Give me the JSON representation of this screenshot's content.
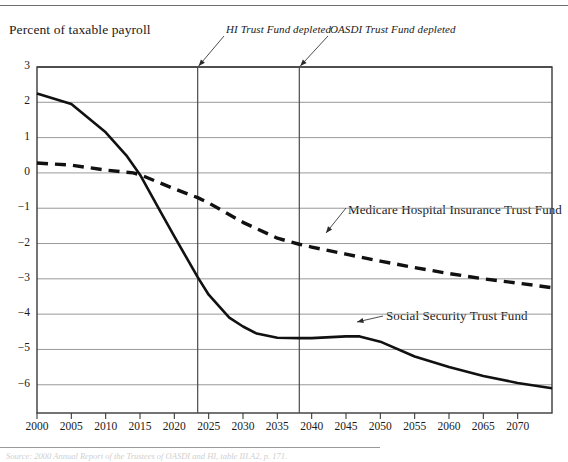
{
  "figure": {
    "y_axis_title": "Percent of taxable payroll",
    "source_note": "Source: 2000 Annual Report of the Trustees of OASDI and HI, table III.A2, p. 171."
  },
  "annotations": [
    {
      "name": "hi-depleted",
      "text": "HI Trust Fund depleted",
      "x_year": 2023.4
    },
    {
      "name": "oasdi-depleted",
      "text": "OASDI Trust Fund depleted",
      "x_year": 2038.2
    }
  ],
  "series_labels": [
    {
      "name": "medicare",
      "text": "Medicare Hospital Insurance Trust Fund"
    },
    {
      "name": "social-security",
      "text": "Social Security Trust Fund"
    }
  ],
  "chart_data": {
    "type": "line",
    "title": "",
    "xlabel": "",
    "ylabel": "Percent of taxable payroll",
    "xlim": [
      2000,
      2075
    ],
    "ylim": [
      -6.8,
      3
    ],
    "grid": true,
    "legend_position": "inline-annotations",
    "x_ticks": [
      2000,
      2005,
      2010,
      2015,
      2020,
      2025,
      2030,
      2035,
      2040,
      2045,
      2050,
      2055,
      2060,
      2065,
      2070
    ],
    "y_ticks": [
      3,
      2,
      1,
      0,
      -1,
      -2,
      -3,
      -4,
      -5,
      -6
    ],
    "x_tick_labels": [
      "2000",
      "2005",
      "2010",
      "2015",
      "2020",
      "2025",
      "2030",
      "2035",
      "2040",
      "2045",
      "2050",
      "2055",
      "2060",
      "2065",
      "2070"
    ],
    "y_tick_labels": [
      "3",
      "2",
      "1",
      "0",
      "−1",
      "−2",
      "−3",
      "−4",
      "−5",
      "−6"
    ],
    "vertical_markers": [
      {
        "label": "HI Trust Fund depleted",
        "x": 2023.4
      },
      {
        "label": "OASDI Trust Fund depleted",
        "x": 2038.2
      }
    ],
    "series": [
      {
        "name": "Social Security Trust Fund",
        "style": "solid",
        "color": "#111111",
        "x": [
          2000,
          2005,
          2010,
          2013,
          2015,
          2018,
          2020,
          2023.4,
          2025,
          2028,
          2030,
          2032,
          2035,
          2038.2,
          2040,
          2045,
          2047,
          2050,
          2055,
          2060,
          2065,
          2070,
          2075
        ],
        "values": [
          2.25,
          1.95,
          1.15,
          0.5,
          -0.05,
          -1.1,
          -1.8,
          -2.95,
          -3.45,
          -4.1,
          -4.35,
          -4.55,
          -4.67,
          -4.68,
          -4.68,
          -4.63,
          -4.63,
          -4.78,
          -5.2,
          -5.5,
          -5.75,
          -5.95,
          -6.1
        ]
      },
      {
        "name": "Medicare Hospital Insurance Trust Fund",
        "style": "dashed",
        "color": "#111111",
        "x": [
          2000,
          2005,
          2010,
          2014,
          2015,
          2020,
          2023.4,
          2025,
          2030,
          2035,
          2038.2,
          2040,
          2045,
          2050,
          2055,
          2060,
          2065,
          2070,
          2075
        ],
        "values": [
          0.28,
          0.22,
          0.08,
          0.0,
          -0.05,
          -0.45,
          -0.7,
          -0.85,
          -1.4,
          -1.85,
          -2.02,
          -2.1,
          -2.3,
          -2.5,
          -2.68,
          -2.85,
          -3.0,
          -3.12,
          -3.25
        ]
      }
    ]
  }
}
